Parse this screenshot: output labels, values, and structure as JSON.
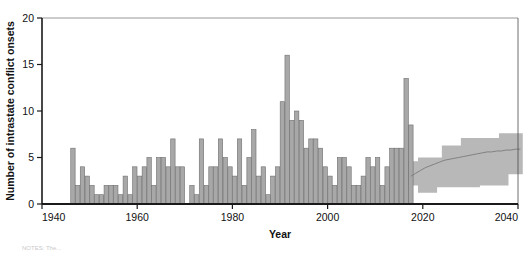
{
  "chart_data": {
    "type": "bar",
    "title": "",
    "xlabel": "Year",
    "ylabel": "Number of intrastate conflict onsets",
    "xlim": [
      1940,
      2040
    ],
    "ylim": [
      0,
      20
    ],
    "xticks": [
      1940,
      1960,
      1980,
      2000,
      2020,
      2040
    ],
    "xtick_labels": [
      "1940",
      "1960",
      "1980",
      "2000",
      "2020",
      "2040"
    ],
    "yticks": [
      0,
      5,
      10,
      15,
      20
    ],
    "ytick_labels": [
      "0",
      "5",
      "10",
      "15",
      "20"
    ],
    "grid": false,
    "legend": "none",
    "bar_color": "#a8a8a8",
    "bar_edge_color": "#6e6e6e",
    "band_color": "#b8b8b8",
    "median_line_color": "#7a7a7a",
    "axis_color": "#1a1a1a",
    "historical_series_name": "Observed conflict onsets",
    "projection_series_name": "Projected conflict onsets",
    "x": [
      1946,
      1947,
      1948,
      1949,
      1950,
      1951,
      1952,
      1953,
      1954,
      1955,
      1956,
      1957,
      1958,
      1959,
      1960,
      1961,
      1962,
      1963,
      1964,
      1965,
      1966,
      1967,
      1968,
      1969,
      1970,
      1971,
      1972,
      1973,
      1974,
      1975,
      1976,
      1977,
      1978,
      1979,
      1980,
      1981,
      1982,
      1983,
      1984,
      1985,
      1986,
      1987,
      1988,
      1989,
      1990,
      1991,
      1992,
      1993,
      1994,
      1995,
      1996,
      1997,
      1998,
      1999,
      2000,
      2001,
      2002,
      2003,
      2004,
      2005,
      2006,
      2007,
      2008,
      2009,
      2010,
      2011,
      2012,
      2013,
      2014,
      2015,
      2016,
      2017
    ],
    "values": [
      6,
      2,
      4,
      3,
      2,
      1,
      1,
      2,
      2,
      2,
      1,
      3,
      1,
      4,
      3,
      4,
      5,
      2,
      5,
      5,
      4,
      7,
      4,
      4,
      0,
      2,
      1,
      7,
      2,
      4,
      4,
      7,
      5,
      4,
      3,
      7,
      2,
      5,
      8,
      3,
      4,
      1,
      3,
      4,
      11,
      16,
      9,
      10,
      9,
      6,
      7,
      7,
      6,
      4,
      3,
      2,
      5,
      5,
      4,
      2,
      2,
      3,
      5,
      4,
      5,
      2,
      4,
      6,
      6,
      6,
      13.5,
      8.5
    ],
    "projection": {
      "x": [
        2017,
        2018,
        2019,
        2020,
        2021,
        2022,
        2023,
        2024,
        2025,
        2026,
        2027,
        2028,
        2029,
        2030,
        2031,
        2032,
        2033,
        2034,
        2035,
        2036,
        2037,
        2038,
        2039,
        2040
      ],
      "median": [
        3.0,
        3.3,
        3.6,
        3.9,
        4.1,
        4.3,
        4.5,
        4.7,
        4.8,
        4.9,
        5.0,
        5.1,
        5.2,
        5.3,
        5.4,
        5.5,
        5.6,
        5.6,
        5.7,
        5.7,
        5.8,
        5.8,
        5.9,
        5.9
      ],
      "lower": [
        2.0,
        2.0,
        1.2,
        1.2,
        1.2,
        1.2,
        1.8,
        1.8,
        1.8,
        1.8,
        1.8,
        1.8,
        1.8,
        1.8,
        1.8,
        2.0,
        2.0,
        2.0,
        2.0,
        2.0,
        2.0,
        3.2,
        3.2,
        3.2
      ],
      "upper": [
        4.6,
        4.6,
        5.0,
        5.0,
        5.0,
        5.0,
        5.0,
        6.3,
        6.3,
        6.3,
        6.3,
        7.1,
        7.1,
        7.1,
        7.1,
        7.1,
        7.1,
        7.1,
        7.1,
        7.6,
        7.6,
        7.6,
        7.6,
        7.6
      ]
    }
  },
  "note": {
    "text": "NOTES: The..."
  }
}
